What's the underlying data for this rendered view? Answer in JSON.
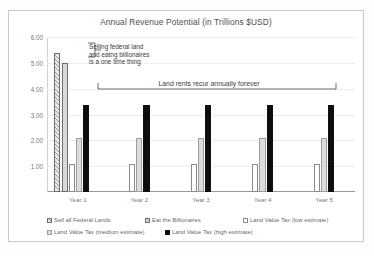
{
  "chart_data": {
    "type": "bar",
    "title": "Annual Revenue Potential (in Trillions $USD)",
    "xlabel": "",
    "ylabel": "",
    "ylim": [
      0,
      6
    ],
    "ytick_labels": [
      "6.00",
      "5.00",
      "4.00",
      "3.00",
      "2.00",
      "1.00"
    ],
    "ytick_values": [
      6,
      5,
      4,
      3,
      2,
      1
    ],
    "grid": true,
    "legend_position": "bottom",
    "categories": [
      "Year 1",
      "Year 2",
      "Year 3",
      "Year 4",
      "Year 5"
    ],
    "series": [
      {
        "name": "Sell all Federal Lands",
        "key": "s-sell",
        "values": [
          5.4,
          0,
          0,
          0,
          0
        ]
      },
      {
        "name": "Eat the Billionaires",
        "key": "s-eat",
        "values": [
          5.0,
          0,
          0,
          0,
          0
        ]
      },
      {
        "name": "Land Value Tax (low estimate)",
        "key": "s-low",
        "values": [
          1.1,
          1.1,
          1.1,
          1.1,
          1.1
        ]
      },
      {
        "name": "Land Value Tax (medium estimate)",
        "key": "s-med",
        "values": [
          2.1,
          2.1,
          2.1,
          2.1,
          2.1
        ]
      },
      {
        "name": "Land Value Tax (high estimate)",
        "key": "s-high",
        "values": [
          3.35,
          3.35,
          3.35,
          3.35,
          3.35
        ]
      }
    ],
    "annotations": [
      {
        "id": "one-time",
        "text": "Selling federal land and eatng billionaires is a one time thing"
      },
      {
        "id": "recurring",
        "text": "Land rents recur annually forever"
      }
    ]
  },
  "legend": {
    "row1": [
      {
        "label": "Sell all Federal Lands",
        "key": "s-sell"
      },
      {
        "label": "Eat the Billionaires",
        "key": "s-eat"
      },
      {
        "label": "Land Value Tax (low estimate)",
        "key": "s-low"
      }
    ],
    "row2": [
      {
        "label": "Land Value Tax (medium estimate)",
        "key": "s-med"
      },
      {
        "label": "Land Value Tax (high estimate)",
        "key": "s-high"
      }
    ]
  }
}
